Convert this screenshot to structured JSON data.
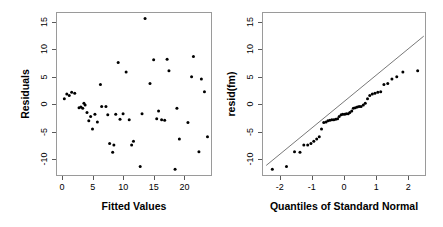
{
  "figure": {
    "width": 443,
    "height": 227,
    "background": "#ffffff",
    "point_color": "#000000",
    "frame_color": "#9a9a9a",
    "line_color": "#555555"
  },
  "chart_data": [
    {
      "type": "scatter",
      "panel": "left",
      "title": "",
      "xlabel": "Fitted Values",
      "ylabel": "Residuals",
      "xlim": [
        -1.0,
        24.5
      ],
      "ylim": [
        -13.0,
        16.8
      ],
      "xticks": [
        0,
        5,
        10,
        15,
        20
      ],
      "yticks": [
        -10,
        -5,
        0,
        5,
        10,
        15
      ],
      "xticklabels": [
        "0",
        "5",
        "10",
        "15",
        "20"
      ],
      "yticklabels": [
        "-10",
        "-5",
        "0",
        "5",
        "10",
        "15"
      ],
      "grid": false,
      "legend": "none",
      "x": [
        0.2,
        0.6,
        1.0,
        1.4,
        1.9,
        2.6,
        2.9,
        3.2,
        3.4,
        3.6,
        3.9,
        4.2,
        4.5,
        4.8,
        5.2,
        5.6,
        6.1,
        6.3,
        7.0,
        7.3,
        7.6,
        8.1,
        8.3,
        8.6,
        9.0,
        9.3,
        9.8,
        10.3,
        10.8,
        11.2,
        11.5,
        12.6,
        12.9,
        13.4,
        14.2,
        14.8,
        15.3,
        15.6,
        16.1,
        16.6,
        17.0,
        17.3,
        18.3,
        18.6,
        19.0,
        20.4,
        21.0,
        21.3,
        22.2,
        22.6,
        23.1,
        23.6
      ],
      "y": [
        1.2,
        2.1,
        1.8,
        2.4,
        2.2,
        -0.4,
        -0.3,
        -0.5,
        0.4,
        0.1,
        -1.3,
        -2.8,
        -2.0,
        -4.3,
        -1.6,
        -3.0,
        3.8,
        -0.2,
        -0.2,
        -1.7,
        -6.9,
        -8.5,
        -7.2,
        -1.6,
        7.8,
        -2.5,
        -1.5,
        6.1,
        -2.6,
        -7.2,
        -6.5,
        -11.1,
        -1.5,
        15.8,
        4.0,
        8.3,
        -2.4,
        -1.0,
        -2.6,
        -2.7,
        8.4,
        6.3,
        -11.6,
        -0.5,
        -6.1,
        -3.1,
        5.2,
        8.9,
        -8.4,
        4.8,
        2.5,
        -5.7
      ]
    },
    {
      "type": "scatter",
      "panel": "right",
      "title": "",
      "xlabel": "Quantiles of Standard Normal",
      "ylabel": "resid(fm)",
      "xlim": [
        -2.55,
        2.55
      ],
      "ylim": [
        -13.0,
        16.8
      ],
      "xticks": [
        -2,
        -1,
        0,
        1,
        2
      ],
      "yticks": [
        -10,
        -5,
        0,
        5,
        10,
        15
      ],
      "xticklabels": [
        "-2",
        "-1",
        "0",
        "1",
        "2"
      ],
      "yticklabels": [
        "-10",
        "-5",
        "0",
        "5",
        "10",
        "15"
      ],
      "grid": false,
      "legend": "none",
      "reference_line": {
        "x": [
          -2.45,
          2.45
        ],
        "y": [
          -10.9,
          12.6
        ]
      },
      "x": [
        -2.26,
        -1.82,
        -1.57,
        -1.4,
        -1.28,
        -1.16,
        -1.06,
        -0.97,
        -0.88,
        -0.8,
        -0.73,
        -0.66,
        -0.59,
        -0.53,
        -0.47,
        -0.41,
        -0.35,
        -0.29,
        -0.23,
        -0.18,
        -0.12,
        -0.07,
        -0.01,
        0.04,
        0.1,
        0.15,
        0.21,
        0.26,
        0.32,
        0.38,
        0.44,
        0.5,
        0.57,
        0.63,
        0.7,
        0.77,
        0.85,
        0.93,
        1.02,
        1.11,
        1.21,
        1.33,
        1.46,
        1.61,
        1.8,
        2.26
      ],
      "y": [
        -11.6,
        -11.1,
        -8.4,
        -8.5,
        -7.2,
        -7.2,
        -6.9,
        -6.5,
        -6.1,
        -5.7,
        -4.3,
        -3.1,
        -3.0,
        -2.8,
        -2.7,
        -2.6,
        -2.6,
        -2.5,
        -2.4,
        -2.0,
        -1.7,
        -1.6,
        -1.6,
        -1.5,
        -1.5,
        -1.3,
        -1.0,
        -0.5,
        -0.4,
        -0.3,
        -0.2,
        -0.2,
        0.1,
        0.4,
        1.2,
        1.8,
        2.1,
        2.2,
        2.4,
        2.5,
        3.8,
        4.0,
        4.8,
        5.2,
        6.1,
        6.3,
        7.8,
        8.3,
        8.4,
        8.9,
        15.8
      ]
    }
  ]
}
